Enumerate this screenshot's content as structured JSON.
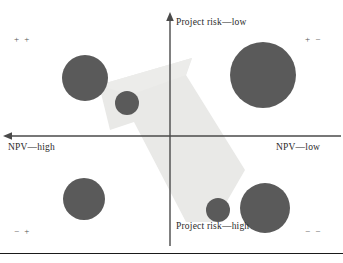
{
  "figure": {
    "title": "",
    "background": "#ffffff"
  },
  "axes": {
    "vertical_top_label": "Project risk—low",
    "vertical_bottom_label": "Project risk—high",
    "horizontal_left_label": "NPV—high",
    "horizontal_right_label": "NPV—low",
    "axis_color": "#4a4a4a",
    "origin": {
      "x": 170,
      "y": 136
    }
  },
  "quadrant_signs": {
    "top_left": "+ +",
    "top_right": "+ −",
    "bottom_left": "− +",
    "bottom_right": "− −"
  },
  "arrow": {
    "name": "strategy-direction-arrow",
    "color": "#e8e8e6",
    "direction": "up-left",
    "description": "Large pale arrow pointing from the lower-right (high risk, low NPV) toward the upper-left (low risk, high NPV)"
  },
  "chart_data": {
    "type": "scatter",
    "title": "",
    "xlabel": "NPV",
    "ylabel": "Project risk",
    "xlim": [
      0,
      343
    ],
    "ylim": [
      0,
      263
    ],
    "grid": false,
    "legend": "none",
    "axis_notes": {
      "x_left_means": "NPV—high",
      "x_right_means": "NPV—low",
      "y_top_means": "Project risk—low",
      "y_bottom_means": "Project risk—high"
    },
    "bubble_color": "#5a5a5a",
    "bubbles": [
      {
        "name": "bubble-top-left-large",
        "cx": 85,
        "cy": 78,
        "r": 23,
        "quadrant": "top_left",
        "npv": "high",
        "risk": "low"
      },
      {
        "name": "bubble-center-small",
        "cx": 127,
        "cy": 103,
        "r": 12,
        "quadrant": "top_left",
        "npv": "high",
        "risk": "low"
      },
      {
        "name": "bubble-top-right-large",
        "cx": 263,
        "cy": 75,
        "r": 33,
        "quadrant": "top_right",
        "npv": "low",
        "risk": "low"
      },
      {
        "name": "bubble-bottom-left",
        "cx": 84,
        "cy": 199,
        "r": 21,
        "quadrant": "bottom_left",
        "npv": "high",
        "risk": "high"
      },
      {
        "name": "bubble-bottom-mid-small",
        "cx": 218,
        "cy": 210,
        "r": 12,
        "quadrant": "bottom_right",
        "npv": "low",
        "risk": "high"
      },
      {
        "name": "bubble-bottom-right",
        "cx": 265,
        "cy": 208,
        "r": 25,
        "quadrant": "bottom_right",
        "npv": "low",
        "risk": "high"
      }
    ]
  },
  "label_positions": {
    "vertical_top": {
      "x": 176,
      "y": 24
    },
    "vertical_bottom": {
      "x": 176,
      "y": 228
    },
    "horizontal_left": {
      "x": 8,
      "y": 142
    },
    "horizontal_right": {
      "x": 276,
      "y": 142
    },
    "sign_top_left": {
      "x": 14,
      "y": 35
    },
    "sign_top_right": {
      "x": 305,
      "y": 35
    },
    "sign_bottom_left": {
      "x": 14,
      "y": 227
    },
    "sign_bottom_right": {
      "x": 305,
      "y": 227
    }
  }
}
